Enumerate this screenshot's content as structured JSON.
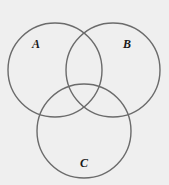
{
  "diagram": {
    "type": "venn",
    "background_color": "#efefef",
    "line_color": "#6b6b6b",
    "label_color": "#1a1a1a",
    "sets": [
      {
        "id": "A",
        "label": "A"
      },
      {
        "id": "B",
        "label": "B"
      },
      {
        "id": "C",
        "label": "C"
      }
    ]
  }
}
